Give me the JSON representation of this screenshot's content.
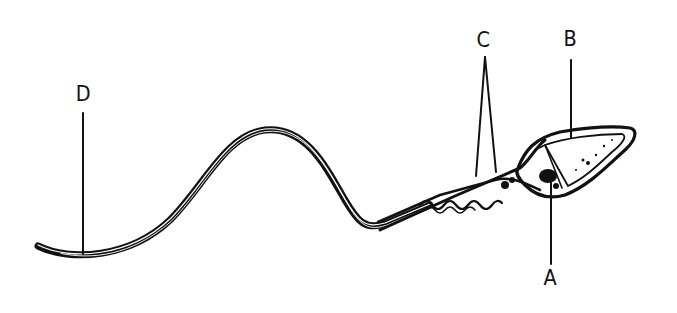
{
  "diagram": {
    "colors": {
      "ink": "#111111",
      "background": "#ffffff"
    },
    "labels": [
      {
        "id": "A",
        "text": "A",
        "points_to": "nucleus (base of head)"
      },
      {
        "id": "B",
        "text": "B",
        "points_to": "head"
      },
      {
        "id": "C",
        "text": "C",
        "points_to": "midpiece (mitochondria)"
      },
      {
        "id": "D",
        "text": "D",
        "points_to": "tail (flagellum)"
      }
    ]
  }
}
